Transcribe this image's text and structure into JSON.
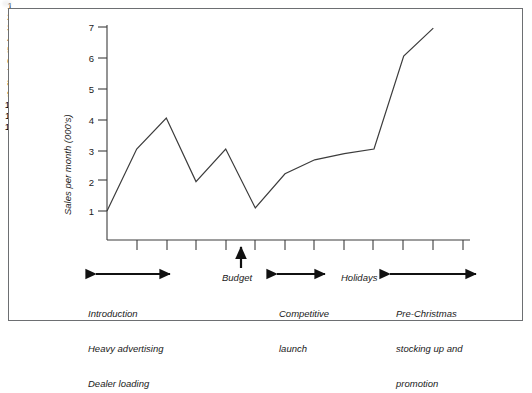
{
  "chart_data": {
    "type": "line",
    "title": "",
    "subtitle": "",
    "xlabel": "",
    "ylabel": "Sales per month (000's)",
    "xlim": [
      0,
      12
    ],
    "ylim": [
      0,
      7
    ],
    "grid": false,
    "legend": null,
    "x": [
      0,
      1,
      2,
      3,
      4,
      5,
      6,
      7,
      8,
      9,
      10,
      11
    ],
    "y": [
      1.0,
      3.0,
      4.0,
      1.95,
      3.0,
      1.1,
      2.2,
      2.65,
      2.85,
      3.0,
      6.0,
      6.9
    ],
    "series": [
      {
        "name": "Sales per month (000's)",
        "values": [
          1.0,
          3.0,
          4.0,
          1.95,
          3.0,
          1.1,
          2.2,
          2.65,
          2.85,
          3.0,
          6.0,
          6.9
        ]
      }
    ],
    "y_ticks": [
      "1",
      "2",
      "3",
      "4",
      "5",
      "6",
      "7"
    ],
    "y_tick_values": [
      1,
      2,
      3,
      4,
      5,
      6,
      7
    ],
    "x_ticks": [
      "1",
      "2",
      "3",
      "4",
      "5",
      "6",
      "7",
      "8",
      "9",
      "10",
      "11",
      "12"
    ],
    "x_tick_values": [
      1,
      2,
      3,
      4,
      5,
      6,
      7,
      8,
      9,
      10,
      11,
      12
    ],
    "line_color": "#3c3c3c",
    "axis_color": "#3c3c3c",
    "background_color": "#ffffff",
    "annotations": [
      {
        "id": "introduction",
        "kind": "span-arrow",
        "label": "Introduction\nHeavy advertising\nDealer loading",
        "lines": [
          "Introduction",
          "Heavy advertising",
          "Dealer loading"
        ],
        "from_x": 0.15,
        "to_x": 2.1
      },
      {
        "id": "budget",
        "kind": "up-arrow",
        "label": "Budget",
        "lines": [
          "Budget"
        ],
        "at_x": 4.5
      },
      {
        "id": "competitive-launch",
        "kind": "span-arrow",
        "label": "Competitive\nlaunch",
        "lines": [
          "Competitive",
          "launch"
        ],
        "from_x": 5.7,
        "to_x": 7.1
      },
      {
        "id": "holidays",
        "kind": "text",
        "label": "Holidays",
        "lines": [
          "Holidays"
        ],
        "at_x": 8.5
      },
      {
        "id": "pre-christmas",
        "kind": "span-arrow",
        "label": "Pre-Christmas\nstocking up and\npromotion",
        "lines": [
          "Pre-Christmas",
          "stocking up and",
          "promotion"
        ],
        "from_x": 9.5,
        "to_x": 12.0
      }
    ]
  },
  "axis": {
    "y_label": "Sales per month (000's)",
    "y_tick_1": "1",
    "y_tick_2": "2",
    "y_tick_3": "3",
    "y_tick_4": "4",
    "y_tick_5": "5",
    "y_tick_6": "6",
    "y_tick_7": "7",
    "x_tick_1": "1",
    "x_tick_2": "2",
    "x_tick_3": "3",
    "x_tick_4": "4",
    "x_tick_5": "5",
    "x_tick_6": "6",
    "x_tick_7": "7",
    "x_tick_8": "8",
    "x_tick_9": "9",
    "x_tick_10": "10",
    "x_tick_11": "11",
    "x_tick_12": "12"
  },
  "annotations": {
    "introduction_line1": "Introduction",
    "introduction_line2": "Heavy advertising",
    "introduction_line3": "Dealer loading",
    "budget": "Budget",
    "competitive_line1": "Competitive",
    "competitive_line2": "launch",
    "holidays": "Holidays",
    "prechristmas_line1": "Pre-Christmas",
    "prechristmas_line2": "stocking up and",
    "prechristmas_line3": "promotion"
  }
}
